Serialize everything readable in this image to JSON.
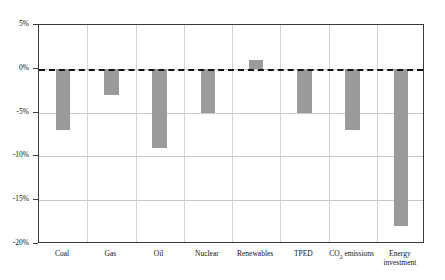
{
  "chart_data": {
    "type": "bar",
    "title": "",
    "subtitle": "",
    "xlabel": "",
    "ylabel": "",
    "categories": [
      "Coal",
      "Gas",
      "Oil",
      "Nuclear",
      "Renewables",
      "TPED",
      "CO2 emissions",
      "Energy investment"
    ],
    "category_labels_display": [
      "Coal",
      "Gas",
      "Oil",
      "Nuclear",
      "Renewables",
      "TPED",
      "CO₂ emissions",
      "Energy\ninvestment"
    ],
    "values": [
      -7,
      -3,
      -9,
      -5,
      1,
      -5,
      -7,
      -18
    ],
    "value_labels": [
      "-7%",
      "-3%",
      "-9%",
      "-5%",
      "1%",
      "-5%",
      "-7%",
      "-18%"
    ],
    "ylim": [
      -20,
      5
    ],
    "ytick_values": [
      5,
      0,
      -5,
      -10,
      -15,
      -20
    ],
    "ytick_labels": [
      "5%",
      "0%",
      "-5%",
      "-10%",
      "-15%",
      "-20%"
    ],
    "grid": "horizontal-and-vertical",
    "legend": "none",
    "zero_line": "dashed",
    "units": "percent",
    "series_name": "Change",
    "colors": {
      "bar": "#9a9a9a",
      "grid": "#c9c9c9",
      "axis": "#3a3a3a",
      "zero_line": "#111111",
      "background": "#ffffff",
      "text": "#111111"
    }
  }
}
